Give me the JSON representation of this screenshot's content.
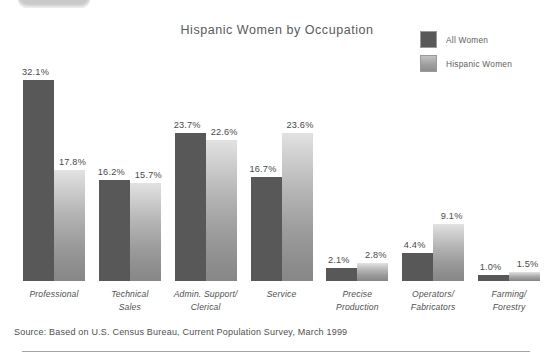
{
  "chart_data": {
    "type": "bar",
    "title": "Hispanic Women by Occupation",
    "xlabel": "",
    "ylabel": "",
    "ylim": [
      0,
      35
    ],
    "grid": false,
    "legend_position": "top-right",
    "value_suffix": "%",
    "categories": [
      "Professional",
      "Technical Sales",
      "Admin. Support/ Clerical",
      "Service",
      "Precise Production",
      "Operators/ Fabricators",
      "Farming/ Forestry"
    ],
    "category_lines": [
      [
        "Professional"
      ],
      [
        "Technical",
        "Sales"
      ],
      [
        "Admin. Support/",
        "Clerical"
      ],
      [
        "Service"
      ],
      [
        "Precise",
        "Production"
      ],
      [
        "Operators/",
        "Fabricators"
      ],
      [
        "Farming/",
        "Forestry"
      ]
    ],
    "series": [
      {
        "name": "All Women",
        "color": "#585858",
        "values": [
          32.1,
          16.2,
          23.7,
          16.7,
          2.1,
          4.4,
          1.0
        ],
        "labels": [
          "32.1%",
          "16.2%",
          "23.7%",
          "16.7%",
          "2.1%",
          "4.4%",
          "1.0%"
        ]
      },
      {
        "name": "Hispanic Women",
        "color": "#a8a8a8",
        "values": [
          17.8,
          15.7,
          22.6,
          23.6,
          2.8,
          9.1,
          1.5
        ],
        "labels": [
          "17.8%",
          "15.7%",
          "22.6%",
          "23.6%",
          "2.8%",
          "9.1%",
          "1.5%"
        ]
      }
    ]
  },
  "legend": {
    "items": [
      {
        "label": "All Women",
        "swatch": "all-women-swatch"
      },
      {
        "label": "Hispanic Women",
        "swatch": "hispanic-women-swatch"
      }
    ]
  },
  "source": {
    "text": "Source:  Based on U.S. Census Bureau, Current Population Survey, March 1999"
  }
}
